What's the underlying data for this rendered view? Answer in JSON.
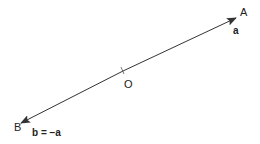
{
  "diagram": {
    "type": "vector-diagram",
    "points": {
      "A": {
        "label": "A"
      },
      "O": {
        "label": "O"
      },
      "B": {
        "label": "B"
      }
    },
    "vectors": [
      {
        "name": "a",
        "label": "a",
        "from": "O",
        "to": "A"
      },
      {
        "name": "b",
        "label": "b = −a",
        "from": "O",
        "to": "B"
      }
    ],
    "colors": {
      "line": "#333333",
      "text": "#222222",
      "background": "#ffffff"
    }
  }
}
